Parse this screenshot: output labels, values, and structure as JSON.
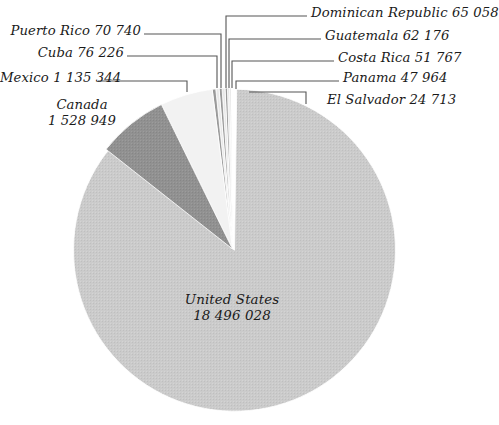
{
  "chart_data": {
    "type": "pie",
    "title": "",
    "subtitle": "",
    "xlabel": "",
    "ylabel": "",
    "grid": false,
    "legend_position": "none",
    "label_format": "name + value (space-separated thousands)",
    "total": 21554041,
    "categories": [
      "United States",
      "Canada",
      "Mexico",
      "Cuba",
      "Puerto Rico",
      "Dominican Republic",
      "Guatemala",
      "Costa Rica",
      "Panama",
      "El Salvador"
    ],
    "values": [
      18496028,
      1528949,
      1135344,
      76226,
      70740,
      65058,
      62176,
      51767,
      47964,
      24713
    ],
    "slices": [
      {
        "name": "United States",
        "value": 18496028,
        "value_text": "18 496 028",
        "color": "#c9c9c9",
        "label_placement": "inside"
      },
      {
        "name": "Canada",
        "value": 1528949,
        "value_text": "1 528 949",
        "color": "#8e8e8e",
        "label_placement": "outside-left"
      },
      {
        "name": "Mexico",
        "value": 1135344,
        "value_text": "1 135 344",
        "color": "#f2f2f2",
        "label_placement": "outside-left"
      },
      {
        "name": "Cuba",
        "value": 76226,
        "value_text": "76 226",
        "color": "#9a9a9a",
        "label_placement": "outside-left"
      },
      {
        "name": "Puerto Rico",
        "value": 70740,
        "value_text": "70 740",
        "color": "#e8e8e8",
        "label_placement": "outside-left"
      },
      {
        "name": "Dominican Republic",
        "value": 65058,
        "value_text": "65 058",
        "color": "#9a9a9a",
        "label_placement": "outside-right"
      },
      {
        "name": "Guatemala",
        "value": 62176,
        "value_text": "62 176",
        "color": "#e8e8e8",
        "label_placement": "outside-right"
      },
      {
        "name": "Costa Rica",
        "value": 51767,
        "value_text": "51 767",
        "color": "#9a9a9a",
        "label_placement": "outside-right"
      },
      {
        "name": "Panama",
        "value": 47964,
        "value_text": "47 964",
        "color": "#e8e8e8",
        "label_placement": "outside-right"
      },
      {
        "name": "El Salvador",
        "value": 24713,
        "value_text": "24 713",
        "color": "#b8b8b8",
        "label_placement": "outside-right"
      }
    ]
  },
  "labels": {
    "united_states": {
      "name": "United States",
      "value": "18 496 028"
    },
    "canada": {
      "name": "Canada",
      "value": "1 528 949"
    },
    "mexico": {
      "text": "Mexico 1 135 344"
    },
    "cuba": {
      "text": "Cuba 76 226"
    },
    "puerto_rico": {
      "text": "Puerto Rico 70 740"
    },
    "dominican_republic": {
      "text": "Dominican Republic 65 058"
    },
    "guatemala": {
      "text": "Guatemala 62 176"
    },
    "costa_rica": {
      "text": "Costa Rica 51 767"
    },
    "panama": {
      "text": "Panama 47 964"
    },
    "el_salvador": {
      "text": "El Salvador 24 713"
    }
  },
  "colors": {
    "background": "#ffffff",
    "text": "#1a1a1a",
    "leader_line": "#555555",
    "slice_large": "#c9c9c9",
    "slice_dark": "#8e8e8e",
    "slice_light": "#f2f2f2"
  }
}
